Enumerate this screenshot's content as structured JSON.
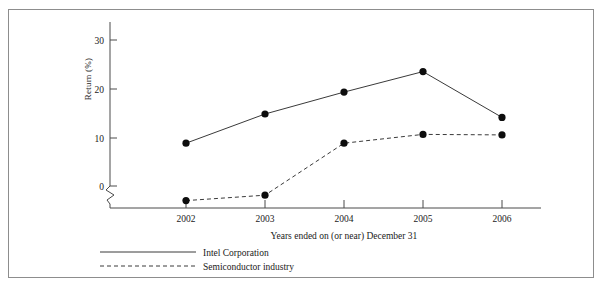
{
  "top_fragment": {
    "left_text": "",
    "right_text": ""
  },
  "chart_data": {
    "type": "line",
    "title": "",
    "subtitle": "",
    "xlabel": "Years ended on (or near) December 31",
    "ylabel": "Return (%)",
    "categories": [
      "2002",
      "2003",
      "2004",
      "2005",
      "2006"
    ],
    "x": [
      2002,
      2003,
      2004,
      2005,
      2006
    ],
    "ylim": [
      -5,
      33
    ],
    "xlim": [
      2001.4,
      2006.9
    ],
    "yticks": [
      0,
      10,
      20,
      30
    ],
    "ytick_labels": [
      "0",
      "10",
      "20",
      "30"
    ],
    "xtick_labels": [
      "2002",
      "2003",
      "2004",
      "2005",
      "2006"
    ],
    "grid": false,
    "axis_break": true,
    "axis_break_note": "zigzag break on y-axis below 0",
    "legend_position": "below-left",
    "series": [
      {
        "name": "Intel Corporation",
        "style": "solid",
        "marker": "filled-circle",
        "values": [
          8.8,
          14.8,
          19.3,
          23.5,
          14.1
        ]
      },
      {
        "name": "Semiconductor industry",
        "style": "dashed",
        "marker": "filled-circle",
        "values": [
          -3.0,
          -1.9,
          8.8,
          10.6,
          10.5
        ]
      }
    ],
    "legend": [
      "Intel Corporation",
      "Semiconductor industry"
    ],
    "colors": {
      "series_line": "#3a3a3a",
      "marker": "#0d0d0d",
      "axis": "#4a4a4a",
      "frame": "#8d8d8d",
      "text": "#1a1a1a",
      "background": "#ffffff"
    }
  }
}
